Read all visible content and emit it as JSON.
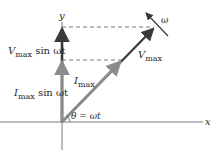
{
  "figure": {
    "type": "phasor-diagram",
    "axes": {
      "x_label": "x",
      "y_label": "y"
    },
    "phasors": [
      {
        "name": "V_max",
        "label_main": "V",
        "label_sub": "max",
        "color": "#3a3a3a"
      },
      {
        "name": "I_max",
        "label_main": "I",
        "label_sub": "max",
        "color": "#8c8c8c"
      }
    ],
    "projections": {
      "voltage": {
        "main": "V",
        "sub": "max",
        "rest": " sin ωt"
      },
      "current": {
        "main": "I",
        "sub": "max",
        "rest": " sin ωt"
      }
    },
    "angle_label": "θ = ωt",
    "rotation_label": "ω",
    "colors": {
      "axis": "#7a7a7a",
      "voltage_arrow": "#3a3a3a",
      "current_arrow": "#8c8c8c",
      "dashed": "#555555",
      "text": "#2a2a2a"
    }
  }
}
